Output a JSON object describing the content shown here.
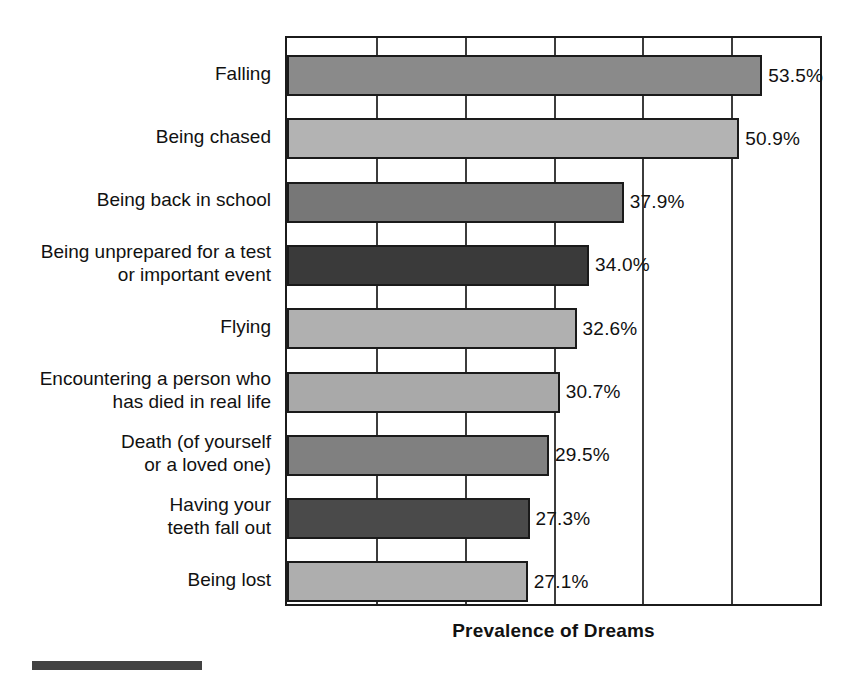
{
  "chart_data": {
    "type": "bar",
    "orientation": "horizontal",
    "title": "",
    "xlabel": "Prevalence of Dreams",
    "ylabel": "",
    "xlim": [
      0,
      60
    ],
    "gridlines": [
      0,
      10,
      20,
      30,
      40,
      50,
      60
    ],
    "grid": true,
    "legend": false,
    "value_suffix": "%",
    "categories": [
      "Falling",
      "Being chased",
      "Being back in school",
      "Being unprepared for a test\nor important event",
      "Flying",
      "Encountering a person who\nhas died in real life",
      "Death (of yourself\nor a loved one)",
      "Having your\nteeth fall out",
      "Being lost"
    ],
    "values": [
      53.5,
      50.9,
      37.9,
      34.0,
      32.6,
      30.7,
      29.5,
      27.3,
      27.1
    ],
    "value_labels": [
      "53.5%",
      "50.9%",
      "37.9%",
      "34.0%",
      "32.6%",
      "30.7%",
      "29.5%",
      "27.3%",
      "27.1%"
    ],
    "bar_colors": [
      "#8a8a8a",
      "#b3b3b3",
      "#777777",
      "#3a3a3a",
      "#b0b0b0",
      "#a9a9a9",
      "#808080",
      "#4a4a4a",
      "#aeaeae"
    ]
  },
  "axis": {
    "x_title": "Prevalence of Dreams"
  },
  "colors": {
    "bar_outline": "#1a1a1a",
    "gridline": "#3c3c3c",
    "plot_border": "#1b1b1b",
    "text": "#111111",
    "background": "#ffffff",
    "footer_rule": "#424242"
  }
}
